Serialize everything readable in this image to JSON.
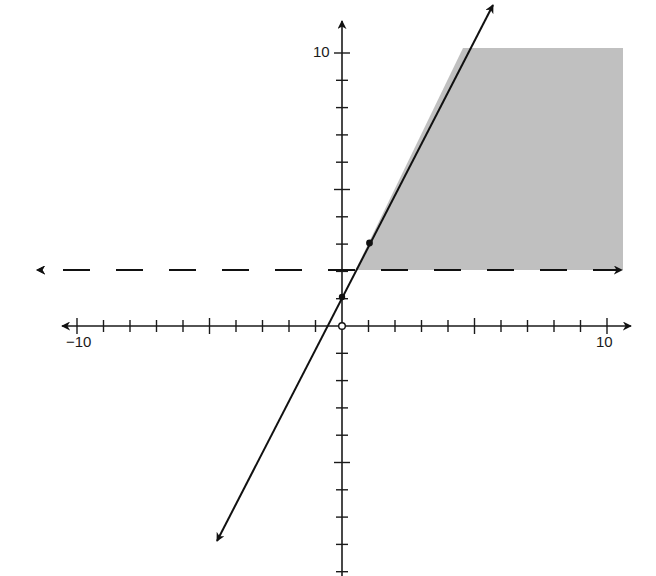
{
  "chart_data": {
    "type": "line",
    "title": "",
    "xlabel": "",
    "ylabel": "",
    "xlim": [
      -10.5,
      10.5
    ],
    "ylim": [
      -9.5,
      10.5
    ],
    "x_tick_labels": [
      {
        "value": -10,
        "label": "−10"
      },
      {
        "value": 10,
        "label": "10"
      }
    ],
    "y_tick_labels": [
      {
        "value": 10,
        "label": "10"
      }
    ],
    "tick_spacing": 1,
    "grid": false,
    "legend": null,
    "series": [
      {
        "name": "solid line",
        "style": "solid",
        "equation": "y = 2x + 1",
        "slope": 2,
        "intercept": 1,
        "arrows": "both",
        "points": [
          {
            "x": 0,
            "y": 1,
            "marker": "filled"
          },
          {
            "x": 1,
            "y": 3,
            "marker": "filled"
          }
        ]
      },
      {
        "name": "dashed line",
        "style": "dashed",
        "equation": "y = 2",
        "arrows": "both"
      }
    ],
    "special_points": [
      {
        "x": 0,
        "y": 0,
        "marker": "open"
      }
    ],
    "shaded_region": {
      "description": "region right of y = 2x + 1 and above y = 2",
      "inequalities": [
        "y < 2x + 1",
        "y > 2"
      ],
      "color": "#bdbdbd"
    }
  },
  "labels": {
    "x_min": "−10",
    "x_max": "10",
    "y_max": "10"
  },
  "colors": {
    "axis": "#1a1a1a",
    "line": "#111111",
    "shade": "#bdbdbd"
  }
}
